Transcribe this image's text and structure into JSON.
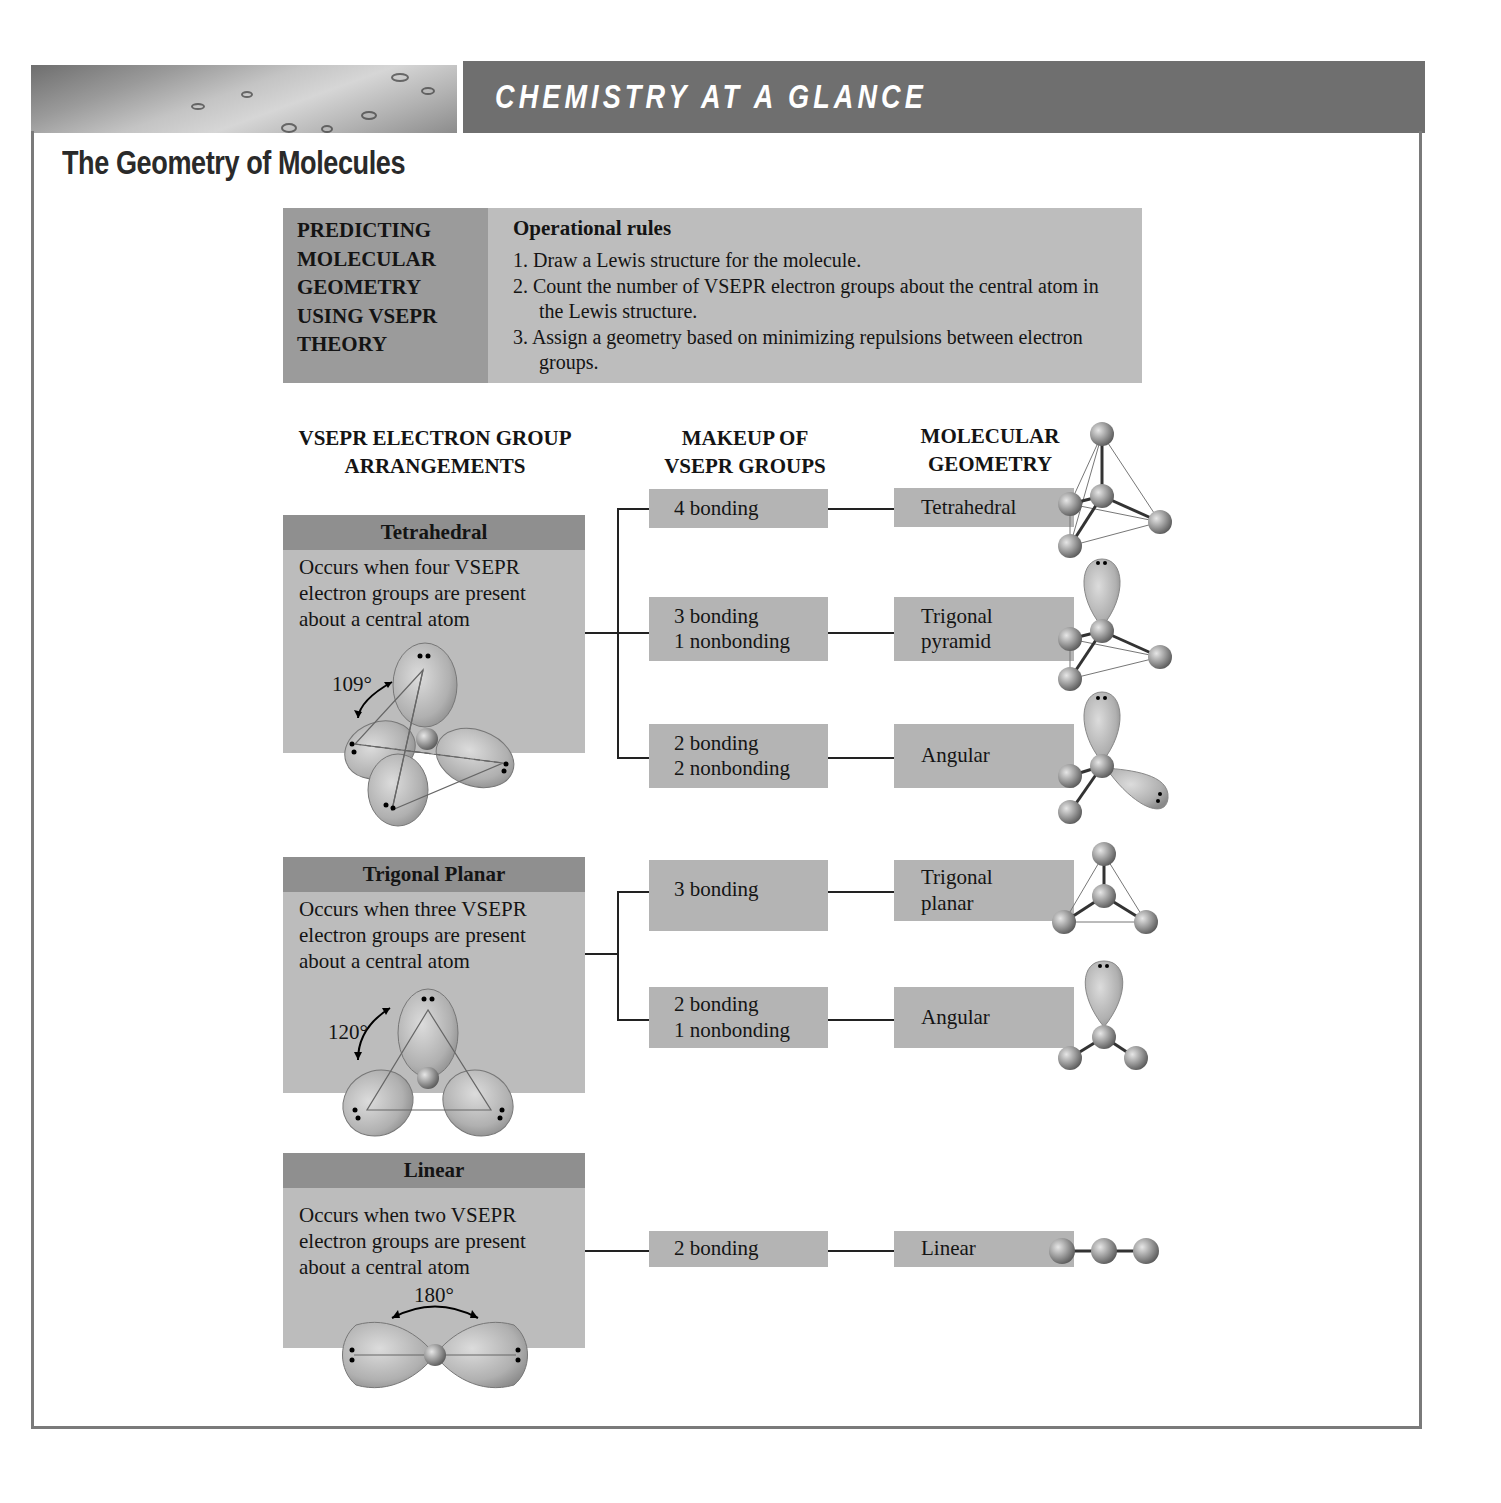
{
  "header": {
    "banner_title": "CHEMISTRY AT A GLANCE",
    "page_title": "The Geometry of Molecules"
  },
  "predicting": {
    "heading_lines": [
      "PREDICTING",
      "MOLECULAR",
      "GEOMETRY",
      "USING VSEPR",
      "THEORY"
    ],
    "rules_title": "Operational rules",
    "rules": [
      "1. Draw a Lewis structure for the molecule.",
      "2. Count the number of VSEPR electron groups about the central atom in the Lewis structure.",
      "3. Assign a geometry based on minimizing repulsions between electron groups."
    ]
  },
  "columns": {
    "arrangements": [
      "VSEPR ELECTRON GROUP",
      "ARRANGEMENTS"
    ],
    "makeup": [
      "MAKEUP OF",
      "VSEPR GROUPS"
    ],
    "geometry": [
      "MOLECULAR",
      "GEOMETRY"
    ]
  },
  "arrangements": [
    {
      "name": "Tetrahedral",
      "description": [
        "Occurs when four VSEPR",
        "electron groups are present",
        "about a central atom"
      ],
      "angle": "109°",
      "outcomes": [
        {
          "makeup": [
            "4 bonding"
          ],
          "geometry": [
            "Tetrahedral"
          ]
        },
        {
          "makeup": [
            "3 bonding",
            "1 nonbonding"
          ],
          "geometry": [
            "Trigonal",
            "pyramid"
          ]
        },
        {
          "makeup": [
            "2 bonding",
            "2 nonbonding"
          ],
          "geometry": [
            "Angular"
          ]
        }
      ]
    },
    {
      "name": "Trigonal Planar",
      "description": [
        "Occurs when three VSEPR",
        "electron groups are present",
        "about a central atom"
      ],
      "angle": "120°",
      "outcomes": [
        {
          "makeup": [
            "3 bonding"
          ],
          "geometry": [
            "Trigonal",
            "planar"
          ]
        },
        {
          "makeup": [
            "2 bonding",
            "1 nonbonding"
          ],
          "geometry": [
            "Angular"
          ]
        }
      ]
    },
    {
      "name": "Linear",
      "description": [
        "Occurs when two VSEPR",
        "electron groups are present",
        "about a central atom"
      ],
      "angle": "180°",
      "outcomes": [
        {
          "makeup": [
            "2 bonding"
          ],
          "geometry": [
            "Linear"
          ]
        }
      ]
    }
  ],
  "colors": {
    "banner": "#6f6f6f",
    "card_head": "#8f8f8f",
    "card_body": "#bcbcbc",
    "box": "#b4b4b4",
    "frame": "#7a7a7a"
  }
}
